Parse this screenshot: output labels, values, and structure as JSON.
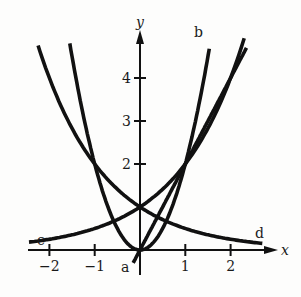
{
  "figure": {
    "axis_labels": {
      "x": "x",
      "y": "y"
    },
    "x_ticks": [
      {
        "value": -2,
        "label": "−2"
      },
      {
        "value": -1,
        "label": "−1"
      },
      {
        "value": 1,
        "label": "1"
      },
      {
        "value": 2,
        "label": "2"
      }
    ],
    "y_ticks": [
      {
        "value": 2,
        "label": "2"
      },
      {
        "value": 3,
        "label": "3"
      },
      {
        "value": 4,
        "label": "4"
      }
    ],
    "curves": [
      {
        "label": "a",
        "description": "straight line through origin, slope 2"
      },
      {
        "label": "b",
        "description": "parabola through origin"
      },
      {
        "label": "c",
        "description": "increasing exponential, y=1 at x=0"
      },
      {
        "label": "d",
        "description": "decreasing exponential, y=1 at x=0"
      }
    ],
    "line_color": "#111111"
  },
  "chart_data": {
    "type": "line",
    "title": "",
    "xlabel": "x",
    "ylabel": "y",
    "xlim": [
      -2.4,
      2.9
    ],
    "ylim": [
      -0.3,
      5
    ],
    "grid": false,
    "series": [
      {
        "name": "a",
        "formula": "y = 2x",
        "x": [
          -0.15,
          0,
          1,
          2,
          2.35
        ],
        "y": [
          -0.3,
          0,
          2,
          4,
          4.7
        ]
      },
      {
        "name": "b",
        "formula": "y = 2x^2",
        "x": [
          -1.55,
          -1,
          0,
          1,
          1.53
        ],
        "y": [
          4.8,
          2,
          0,
          2,
          4.7
        ]
      },
      {
        "name": "c",
        "formula": "y = 2^x",
        "x": [
          -2.4,
          -2,
          -1,
          0,
          1,
          2,
          2.3
        ],
        "y": [
          0.19,
          0.25,
          0.5,
          1,
          2,
          4,
          4.9
        ]
      },
      {
        "name": "d",
        "formula": "y = 2^-x",
        "x": [
          -2.25,
          -2,
          -1,
          0,
          1,
          2,
          2.7
        ],
        "y": [
          4.76,
          4,
          2,
          1,
          0.5,
          0.25,
          0.15
        ]
      }
    ]
  }
}
